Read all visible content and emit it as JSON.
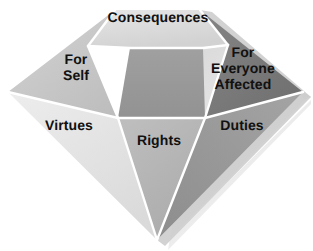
{
  "diagram": {
    "shape": "diamond",
    "background_color": "#ffffff",
    "facet_edge_color": "#ffffff",
    "label_color": "#111111",
    "shadow_color": "#c9c9c9",
    "facets": [
      {
        "id": "table",
        "name": "consequences",
        "label": "Consequences",
        "region": "crown-table",
        "color": "#dcdcdc",
        "points": "115,10 200,10 228,45 203,48 130,48 88,46"
      },
      {
        "id": "crown-left",
        "name": "for-self",
        "label": "For\nSelf",
        "region": "crown-left",
        "color": "#c8c8c8",
        "points": "115,10 88,46 118,118 8,92"
      },
      {
        "id": "crown-center",
        "name": "crown-center",
        "label": "",
        "region": "crown-center",
        "color": "#999999",
        "points": "130,48 203,48 205,118 118,118"
      },
      {
        "id": "crown-right",
        "name": "for-everyone-affected",
        "label": "For\nEveryone\nAffected",
        "region": "crown-right",
        "color": "#7a7a7a",
        "points": "200,10 303,92 205,118 228,45"
      },
      {
        "id": "pavilion-left",
        "name": "virtues",
        "label": "Virtues",
        "region": "pavilion-left",
        "color": "#e4e4e4",
        "points": "8,92 118,118 157,240"
      },
      {
        "id": "pavilion-center",
        "name": "rights",
        "label": "Rights",
        "region": "pavilion-center",
        "color": "#b4b4b4",
        "points": "118,118 205,118 157,240"
      },
      {
        "id": "pavilion-right",
        "name": "duties",
        "label": "Duties",
        "region": "pavilion-right",
        "color": "#9a9a9a",
        "points": "205,118 303,92 157,240"
      }
    ],
    "labels": {
      "consequences": "Consequences",
      "for_self": "For\nSelf",
      "for_everyone_affected": "For\nEveryone\nAffected",
      "virtues": "Virtues",
      "rights": "Rights",
      "duties": "Duties"
    }
  }
}
